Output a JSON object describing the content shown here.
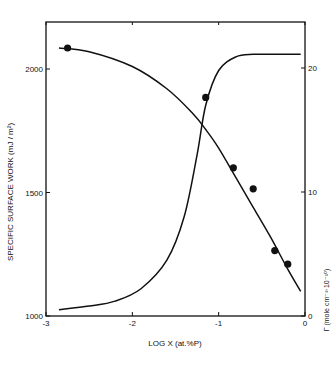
{
  "chart_data": {
    "type": "line",
    "title": "",
    "xlabel": "LOG X (at.% P)",
    "ylabel": "SPECIFIC SURFACE WORK (mJ/m²)",
    "ylabel_right": "Γ (mole cm⁻² · 10⁻¹⁰)",
    "xlim": [
      -3,
      0
    ],
    "ylim": [
      1000,
      2200
    ],
    "ylim_right": [
      0,
      23
    ],
    "x_ticks": [
      "-3",
      "-2",
      "-1",
      "0"
    ],
    "y_ticks": [
      "1000",
      "1500",
      "2000"
    ],
    "y_ticks_right": [
      "0",
      "10",
      "20"
    ],
    "grid": false,
    "series": [
      {
        "name": "Specific surface work (curve)",
        "axis": "left",
        "x": [
          -2.85,
          -2.5,
          -2.0,
          -1.6,
          -1.3,
          -1.15,
          -1.0,
          -0.8,
          -0.6,
          -0.4,
          -0.2,
          -0.05
        ],
        "y": [
          2085,
          2070,
          2010,
          1920,
          1820,
          1755,
          1680,
          1560,
          1440,
          1320,
          1190,
          1100
        ]
      },
      {
        "name": "Specific surface work (measured)",
        "axis": "left",
        "marker": "filled-circle",
        "x": [
          -2.75,
          -1.15,
          -0.83,
          -0.6,
          -0.35,
          -0.2
        ],
        "y": [
          2085,
          1885,
          1600,
          1515,
          1265,
          1210
        ]
      },
      {
        "name": "Adsorption Γ",
        "axis": "right",
        "x": [
          -2.85,
          -2.5,
          -2.2,
          -1.9,
          -1.6,
          -1.4,
          -1.25,
          -1.15,
          -1.0,
          -0.8,
          -0.6,
          -0.4,
          -0.2,
          -0.05
        ],
        "y": [
          0.5,
          0.8,
          1.2,
          2.2,
          4.5,
          8.0,
          13.0,
          17.0,
          19.8,
          20.9,
          21.1,
          21.1,
          21.1,
          21.1
        ]
      }
    ]
  },
  "labels": {
    "xlabel": "LOG  X  (at.%P)",
    "ylabel": "SPECIFIC  SURFACE  WORK  (mJ / m²)",
    "ylabel_right": "Γ (mole cm⁻²·10⁻¹⁰)"
  }
}
